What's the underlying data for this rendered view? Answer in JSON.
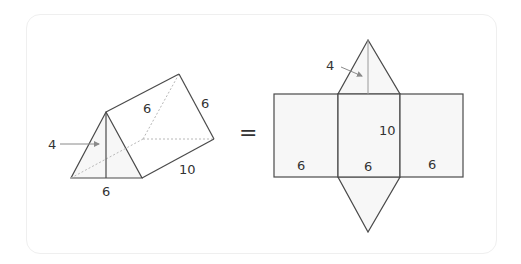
{
  "figure": {
    "prism": {
      "height_label": "4",
      "base_label": "6",
      "slant_label_top": "6",
      "slant_label_back": "6",
      "length_label": "10"
    },
    "equals": "=",
    "net": {
      "height_label": "4",
      "length_label": "10",
      "left_face_label": "6",
      "middle_face_label": "6",
      "right_face_label": "6"
    },
    "colors": {
      "stroke": "#4a4a4a",
      "face_fill": "#f7f7f7",
      "hidden_edge": "#b8b8b8",
      "arrow": "#8a8a8a"
    }
  }
}
